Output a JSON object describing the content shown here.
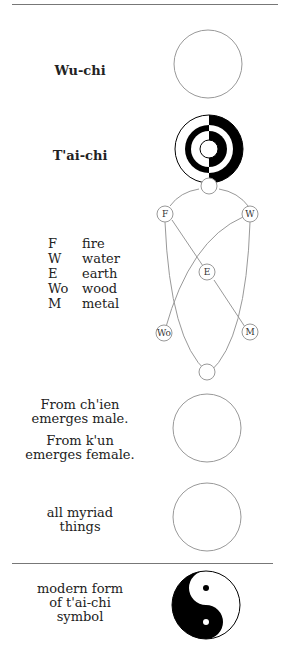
{
  "stages": {
    "wu_chi": {
      "label": "Wu-chi"
    },
    "tai_chi": {
      "label": "T'ai-chi"
    },
    "qian_kun": {
      "line1": "From  ch'ien",
      "line2": "emerges  male.",
      "line3": "From  k'un",
      "line4": "emerges  female."
    },
    "myriad": {
      "line1": "all  myriad",
      "line2": "things"
    },
    "modern": {
      "line1": "modern  form",
      "line2": "of  t'ai-chi",
      "line3": "symbol"
    }
  },
  "legend": [
    {
      "abbr": "F",
      "name": "fire"
    },
    {
      "abbr": "W",
      "name": "water"
    },
    {
      "abbr": "E",
      "name": "earth"
    },
    {
      "abbr": "Wo",
      "name": "wood"
    },
    {
      "abbr": "M",
      "name": "metal"
    }
  ],
  "nodes": {
    "fire": "F",
    "water": "W",
    "earth": "E",
    "wood": "Wo",
    "metal": "M"
  },
  "colors": {
    "line": "#888888",
    "fill": "#000000",
    "background": "#ffffff"
  }
}
